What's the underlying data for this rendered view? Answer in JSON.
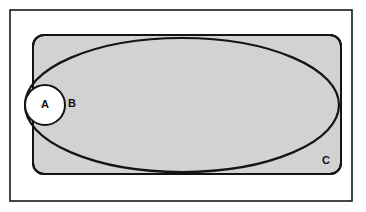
{
  "diagram": {
    "type": "euler-venn-set-diagram",
    "title": "",
    "universe": {
      "name": "universal-set-frame",
      "shape": "rectangle",
      "x": 10,
      "y": 10,
      "width": 342,
      "height": 191,
      "fill": "#ffffff",
      "stroke": "#1a1a1a",
      "stroke_width": 1.6,
      "label": ""
    },
    "sets": [
      {
        "id": "C",
        "label": "C",
        "shape": "rounded-rectangle",
        "x": 33,
        "y": 35,
        "width": 308,
        "height": 139,
        "corner_radius": 11,
        "fill": "#d2d2d2",
        "stroke": "#141414",
        "stroke_width": 2.0,
        "label_x": 326,
        "label_y": 161
      },
      {
        "id": "B",
        "label": "B",
        "shape": "ellipse",
        "cx": 182,
        "cy": 105,
        "rx": 157,
        "ry": 67,
        "fill": "none",
        "stroke": "#141414",
        "stroke_width": 2.2,
        "label_x": 72,
        "label_y": 104
      },
      {
        "id": "A",
        "label": "A",
        "shape": "circle",
        "cx": 45,
        "cy": 105,
        "r": 20,
        "fill": "#ffffff",
        "stroke": "#141414",
        "stroke_width": 2.0,
        "label_x": 45,
        "label_y": 105
      }
    ],
    "relations": {
      "a_in_b": true,
      "b_overlaps_c": true,
      "a_outside_c": true
    },
    "colors": {
      "page_background": "#ffffff",
      "shaded_region": "#d2d2d2",
      "outline": "#141414",
      "frame": "#1a1a1a",
      "label_text": "#111111"
    }
  }
}
